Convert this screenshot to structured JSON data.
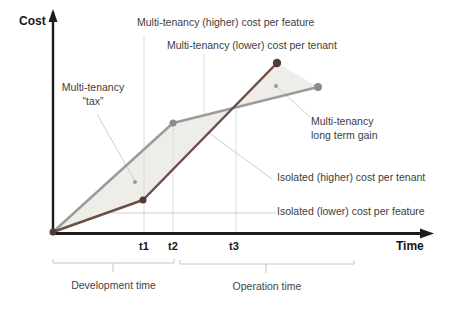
{
  "figure": {
    "y_axis_label": "Cost",
    "x_axis_label": "Time",
    "ticks": [
      "t1",
      "t2",
      "t3"
    ],
    "annotations": {
      "mt_higher": "Multi-tenancy (higher) cost per feature",
      "mt_lower": "Multi-tenancy (lower) cost per tenant",
      "mt_tax_line1": "Multi-tenancy",
      "mt_tax_line2": "“tax”",
      "mt_gain_line1": "Multi-tenancy",
      "mt_gain_line2": "long term gain",
      "iso_higher": "Isolated (higher) cost per tenant",
      "iso_lower": "Isolated (lower) cost per feature"
    },
    "phases": {
      "development": "Development time",
      "operation": "Operation time"
    }
  },
  "chart_data": {
    "type": "line",
    "title": "",
    "xlabel": "Time",
    "ylabel": "Cost",
    "x_ticks": [
      "t1",
      "t2",
      "t3"
    ],
    "x_tick_positions_norm": [
      0.24,
      0.32,
      0.48
    ],
    "grid": "partial-vertical-guides",
    "legend_position": "none (leader-line annotations)",
    "series": [
      {
        "name": "Multi-tenancy cost",
        "color": "#9b9b9b",
        "marker_color": "#8b8b8b",
        "x_norm": [
          0,
          0.32,
          0.7
        ],
        "y_norm": [
          0,
          0.64,
          0.84
        ],
        "points_px": [
          [
            53,
            232
          ],
          [
            173,
            123
          ],
          [
            318,
            87
          ]
        ],
        "markers_px": [
          [
            173,
            123,
            3.5
          ],
          [
            318,
            87,
            4
          ]
        ]
      },
      {
        "name": "Isolated cost",
        "color": "#6e4f48",
        "marker_color": "#4f3c36",
        "x_norm": [
          0,
          0.24,
          0.59
        ],
        "y_norm": [
          0,
          0.19,
          0.98
        ],
        "points_px": [
          [
            53,
            232
          ],
          [
            143,
            200
          ],
          [
            277,
            63
          ]
        ],
        "markers_px": [
          [
            53,
            232,
            3.5
          ],
          [
            143,
            200,
            3.5
          ],
          [
            277,
            63,
            4.2
          ]
        ]
      }
    ],
    "crossing_point_px": [
      236,
      108
    ],
    "fill_polygon_px": [
      [
        53,
        232
      ],
      [
        173,
        123
      ],
      [
        318,
        87
      ],
      [
        277,
        63
      ],
      [
        143,
        200
      ]
    ],
    "fill_color": "#eeede7",
    "annotation_dots_px": [
      [
        135,
        182
      ],
      [
        276,
        86
      ]
    ],
    "annotation_dot_color": "#9a9a9a"
  },
  "colors": {
    "axis": "#1c1c1c",
    "gridline": "#dcdcdc",
    "leader": "#cfcfcf",
    "brace": "#c4c4c4"
  }
}
